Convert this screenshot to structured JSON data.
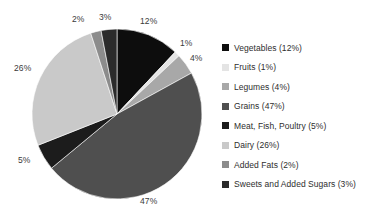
{
  "chart_data": {
    "type": "pie",
    "title": "",
    "subtitle": "",
    "xlabel": "",
    "ylabel": "",
    "grid": false,
    "legend_position": "right",
    "start_angle_deg": 0,
    "direction": "clockwise",
    "categories": [
      "Vegetables",
      "Fruits",
      "Legumes",
      "Grains",
      "Meat, Fish, Poultry",
      "Dairy",
      "Added Fats",
      "Sweets and Added Sugars"
    ],
    "values": [
      12,
      1,
      4,
      47,
      5,
      26,
      2,
      3
    ],
    "value_unit": "%",
    "colors": [
      "#0d0d0d",
      "#e4e4e4",
      "#a8a8a8",
      "#4f4f4f",
      "#1c1c1c",
      "#c9c9c9",
      "#8c8c8c",
      "#2b2b2b"
    ],
    "slice_labels": [
      "12%",
      "1%",
      "4%",
      "47%",
      "5%",
      "26%",
      "2%",
      "3%"
    ],
    "legend_entries": [
      "Vegetables (12%)",
      "Fruits (1%)",
      "Legumes (4%)",
      "Grains (47%)",
      "Meat, Fish, Poultry (5%)",
      "Dairy (26%)",
      "Added Fats (2%)",
      "Sweets and Added Sugars (3%)"
    ]
  },
  "pie": {
    "center_x": 117,
    "center_y": 114,
    "radius": 85,
    "labels": [
      {
        "text": "12%",
        "x": 140,
        "y": 16
      },
      {
        "text": "1%",
        "x": 180,
        "y": 38
      },
      {
        "text": "4%",
        "x": 190,
        "y": 53
      },
      {
        "text": "47%",
        "x": 140,
        "y": 196
      },
      {
        "text": "5%",
        "x": 18,
        "y": 155
      },
      {
        "text": "26%",
        "x": 14,
        "y": 63
      },
      {
        "text": "2%",
        "x": 72,
        "y": 14
      },
      {
        "text": "3%",
        "x": 99,
        "y": 12
      }
    ]
  }
}
